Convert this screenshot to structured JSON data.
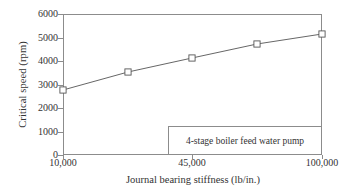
{
  "chart_data": {
    "type": "line",
    "title": "",
    "xlabel": "Journal bearing stiffness (lb/in.)",
    "ylabel": "Critical speed (rpm)",
    "annotation": "4-stage boiler feed water pump",
    "grid": false,
    "legend_position": "none",
    "xscale": "compressed",
    "xlim": [
      10000,
      100000
    ],
    "ylim": [
      0,
      6000
    ],
    "xtick_labels": [
      "10,000",
      "45,000",
      "100,000"
    ],
    "xtick_values": [
      10000,
      45000,
      100000
    ],
    "xtick_positions_px": [
      63,
      192,
      322
    ],
    "ytick_labels": [
      "0",
      "1000",
      "2000",
      "3000",
      "4000",
      "5000",
      "6000"
    ],
    "ytick_values": [
      0,
      1000,
      2000,
      3000,
      4000,
      5000,
      6000
    ],
    "series": [
      {
        "name": "Critical speed",
        "marker": "open-square",
        "line_color": "#555555",
        "marker_color": "#555555",
        "marker_fill": "#ffffff",
        "x": [
          10000,
          22500,
          45000,
          70000,
          100000
        ],
        "y": [
          2750,
          3500,
          4100,
          4700,
          5100
        ],
        "points_px": [
          {
            "x": 63,
            "y": 90
          },
          {
            "x": 128,
            "y": 72
          },
          {
            "x": 192,
            "y": 58
          },
          {
            "x": 257,
            "y": 44
          },
          {
            "x": 322,
            "y": 34
          }
        ]
      }
    ],
    "colors": {
      "axis": "#8c8c8c",
      "text": "#333333",
      "line": "#555555",
      "background": "#ffffff"
    }
  }
}
